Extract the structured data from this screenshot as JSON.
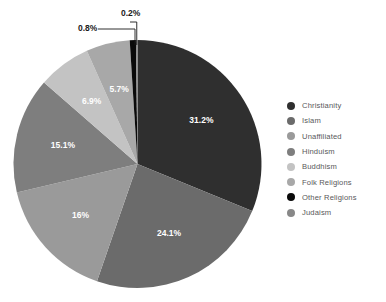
{
  "chart_data": {
    "type": "pie",
    "title": "",
    "subtitle": "",
    "xlabel": "",
    "ylabel": "",
    "grid": false,
    "legend_position": "right",
    "units": "percent",
    "start_angle_deg": 0,
    "direction": "clockwise",
    "categories": [
      "Christianity",
      "Islam",
      "Unaffiliated",
      "Hinduism",
      "Buddhism",
      "Folk Religions",
      "Other Religions",
      "Judaism"
    ],
    "values": [
      31.2,
      24.1,
      16,
      15.1,
      6.9,
      5.7,
      0.8,
      0.2
    ],
    "labels": [
      "31.2%",
      "24.1%",
      "16%",
      "15.1%",
      "6.9%",
      "5.7%",
      "0.8%",
      "0.2%"
    ],
    "colors": [
      "#2f2f2f",
      "#6b6b6b",
      "#9a9a9a",
      "#7e7e7e",
      "#c3c3c3",
      "#a8a8a8",
      "#0a0a0a",
      "#888888"
    ],
    "callout_slices": [
      "Other Religions",
      "Judaism"
    ],
    "slices": [
      {
        "name": "Christianity",
        "value": 31.2,
        "label": "31.2%",
        "color": "#2f2f2f"
      },
      {
        "name": "Islam",
        "value": 24.1,
        "label": "24.1%",
        "color": "#6b6b6b"
      },
      {
        "name": "Unaffiliated",
        "value": 16,
        "label": "16%",
        "color": "#9a9a9a"
      },
      {
        "name": "Hinduism",
        "value": 15.1,
        "label": "15.1%",
        "color": "#7e7e7e"
      },
      {
        "name": "Buddhism",
        "value": 6.9,
        "label": "6.9%",
        "color": "#c3c3c3"
      },
      {
        "name": "Folk Religions",
        "value": 5.7,
        "label": "5.7%",
        "color": "#a8a8a8"
      },
      {
        "name": "Other Religions",
        "value": 0.8,
        "label": "0.8%",
        "color": "#0a0a0a"
      },
      {
        "name": "Judaism",
        "value": 0.2,
        "label": "0.2%",
        "color": "#888888"
      }
    ]
  },
  "legend": {
    "items": [
      {
        "label": "Christianity",
        "color": "#2f2f2f"
      },
      {
        "label": "Islam",
        "color": "#6b6b6b"
      },
      {
        "label": "Unaffiliated",
        "color": "#9a9a9a"
      },
      {
        "label": "Hinduism",
        "color": "#7e7e7e"
      },
      {
        "label": "Buddhism",
        "color": "#c3c3c3"
      },
      {
        "label": "Folk Religions",
        "color": "#a8a8a8"
      },
      {
        "label": "Other Religions",
        "color": "#0a0a0a"
      },
      {
        "label": "Judaism",
        "color": "#888888"
      }
    ]
  },
  "callouts": [
    {
      "label": "0.8%",
      "x": 78,
      "y": 29
    },
    {
      "label": "0.2%",
      "x": 121,
      "y": 14
    }
  ],
  "geometry": {
    "cx": 137.5,
    "cy": 164,
    "r": 124,
    "label_radius_frac": 0.62
  },
  "style": {
    "background": "#ffffff",
    "legend_text_color": "#58585a",
    "slice_label_color": "#ffffff",
    "callout_color": "#1a1a1a"
  }
}
